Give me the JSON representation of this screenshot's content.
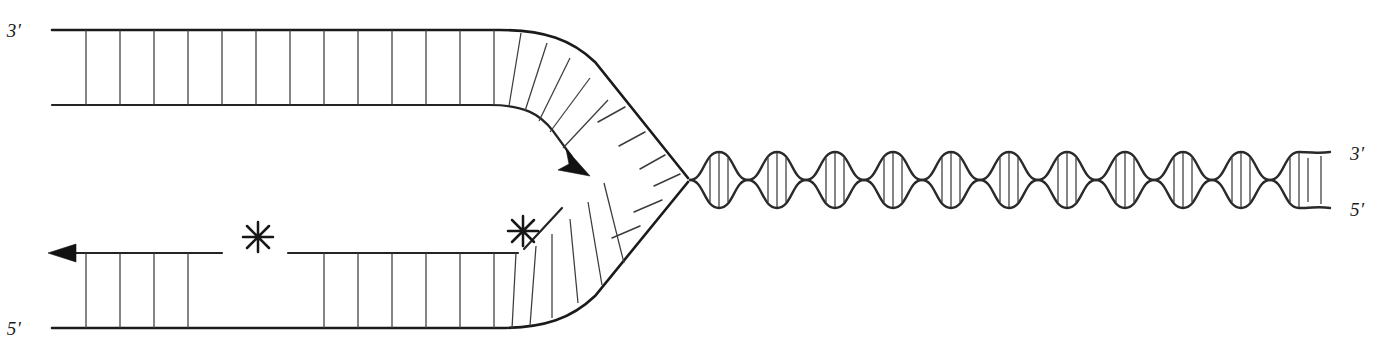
{
  "figure": {
    "title": "DNA replication fork with leading and lagging strand synthesis",
    "kind": "diagram",
    "width": 1384,
    "height": 352,
    "background_color": "#ffffff",
    "ink_color": "#1b1b1b",
    "rung_color": "#3c3c3c"
  },
  "labels": {
    "top_left_end": "3′",
    "bottom_left_end": "5′",
    "right_top_end": "3′",
    "right_bottom_end": "5′"
  },
  "annotations": {
    "nick_marker_glyph": "✳",
    "nick_marker_count": 2,
    "arrow_count": 3,
    "markers": [
      {
        "name": "rna-primer-nick-left",
        "x": 258,
        "y": 237
      },
      {
        "name": "rna-primer-nick-right",
        "x": 523,
        "y": 231
      }
    ]
  },
  "duplex_geometry": {
    "top_inner_y": 30,
    "top_outer_y": 105,
    "bottom_inner_y": 253,
    "bottom_outer_y": 328,
    "left_edge_x": 52,
    "rung_spacing": 34,
    "fork_junction_x": 690,
    "fork_junction_y": 180
  },
  "helix_geometry": {
    "lobe_count": 11,
    "start_x": 690,
    "end_x": 1330,
    "center_y": 180,
    "amplitude": 28,
    "rungs_per_lobe": 3
  },
  "strand_rungs": {
    "top_straight_count": 13,
    "bottom_left_count": 4,
    "bottom_right_count": 7,
    "top_curved_count": 5,
    "bottom_curved_count": 5,
    "top_unpaired_tick_count": 3,
    "bottom_unpaired_tick_count": 3
  },
  "gap": {
    "name": "lagging-strand-gap",
    "start_x": 222,
    "end_x": 288
  }
}
